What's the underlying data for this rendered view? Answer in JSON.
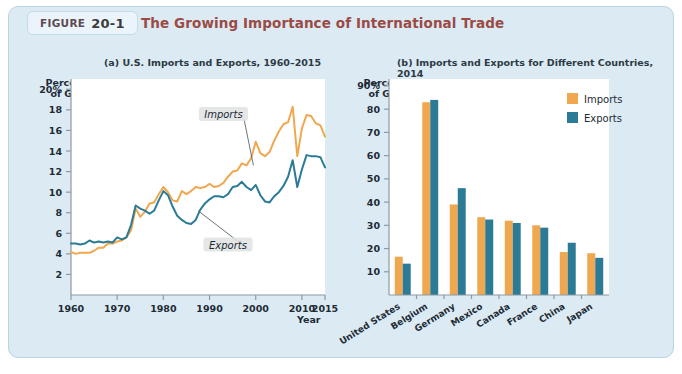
{
  "figure": {
    "tag_label": "FIGURE",
    "number": "20-1",
    "title": "The Growing Importance of International Trade",
    "title_color": "#9b4a45",
    "panel_bg": "#dceaf3"
  },
  "colors": {
    "imports": "#efa84f",
    "exports": "#2c7b96",
    "axis": "#8a9aa6",
    "text": "#1d2b36"
  },
  "chart_data": [
    {
      "type": "line",
      "panel": "a",
      "title": "(a) U.S. Imports and Exports, 1960–2015",
      "ylabel": "Percent of GDP",
      "xlabel": "Year",
      "ylim": [
        0,
        21
      ],
      "xlim": [
        1960,
        2015
      ],
      "yticks": [
        2,
        4,
        6,
        8,
        10,
        12,
        14,
        16,
        18,
        20
      ],
      "ytick_labels": [
        "2",
        "4",
        "6",
        "8",
        "10",
        "12",
        "14",
        "16",
        "18",
        "20%"
      ],
      "xticks": [
        1960,
        1970,
        1980,
        1990,
        2000,
        2010,
        2015
      ],
      "xtick_labels": [
        "1960",
        "1970",
        "1980",
        "1990",
        "2000",
        "2010",
        "2015"
      ],
      "grid": false,
      "annotations": [
        {
          "label": "Imports",
          "x": 1993,
          "y": 17.6
        },
        {
          "label": "Exports",
          "x": 1994,
          "y": 4.9
        }
      ],
      "series": [
        {
          "name": "Imports",
          "color": "#efa84f",
          "x": [
            1960,
            1961,
            1962,
            1963,
            1964,
            1965,
            1966,
            1967,
            1968,
            1969,
            1970,
            1971,
            1972,
            1973,
            1974,
            1975,
            1976,
            1977,
            1978,
            1979,
            1980,
            1981,
            1982,
            1983,
            1984,
            1985,
            1986,
            1987,
            1988,
            1989,
            1990,
            1991,
            1992,
            1993,
            1994,
            1995,
            1996,
            1997,
            1998,
            1999,
            2000,
            2001,
            2002,
            2003,
            2004,
            2005,
            2006,
            2007,
            2008,
            2009,
            2010,
            2011,
            2012,
            2013,
            2014,
            2015
          ],
          "values": [
            4.2,
            4.0,
            4.1,
            4.1,
            4.1,
            4.3,
            4.6,
            4.6,
            5.0,
            5.0,
            5.2,
            5.3,
            5.6,
            6.3,
            8.4,
            7.6,
            8.1,
            8.9,
            9.0,
            9.8,
            10.5,
            10.0,
            9.2,
            9.1,
            10.1,
            9.8,
            10.1,
            10.5,
            10.4,
            10.5,
            10.8,
            10.5,
            10.6,
            10.9,
            11.5,
            12.0,
            12.1,
            12.8,
            12.6,
            13.3,
            14.9,
            13.8,
            13.5,
            13.9,
            15.0,
            15.9,
            16.6,
            16.8,
            18.3,
            13.5,
            16.2,
            17.5,
            17.4,
            16.7,
            16.5,
            15.4
          ]
        },
        {
          "name": "Exports",
          "color": "#2c7b96",
          "x": [
            1960,
            1961,
            1962,
            1963,
            1964,
            1965,
            1966,
            1967,
            1968,
            1969,
            1970,
            1971,
            1972,
            1973,
            1974,
            1975,
            1976,
            1977,
            1978,
            1979,
            1980,
            1981,
            1982,
            1983,
            1984,
            1985,
            1986,
            1987,
            1988,
            1989,
            1990,
            1991,
            1992,
            1993,
            1994,
            1995,
            1996,
            1997,
            1998,
            1999,
            2000,
            2001,
            2002,
            2003,
            2004,
            2005,
            2006,
            2007,
            2008,
            2009,
            2010,
            2011,
            2012,
            2013,
            2014,
            2015
          ],
          "values": [
            5.0,
            5.0,
            4.9,
            5.0,
            5.3,
            5.1,
            5.2,
            5.1,
            5.2,
            5.1,
            5.6,
            5.4,
            5.6,
            6.8,
            8.7,
            8.4,
            8.2,
            7.9,
            8.2,
            9.2,
            10.1,
            9.7,
            8.6,
            7.7,
            7.3,
            7.0,
            6.9,
            7.3,
            8.3,
            8.9,
            9.3,
            9.6,
            9.6,
            9.5,
            9.8,
            10.5,
            10.6,
            11.0,
            10.5,
            10.2,
            10.7,
            9.7,
            9.1,
            9.0,
            9.6,
            10.0,
            10.6,
            11.5,
            13.1,
            10.5,
            12.2,
            13.6,
            13.5,
            13.5,
            13.4,
            12.4
          ]
        }
      ]
    },
    {
      "type": "bar",
      "panel": "b",
      "title": "(b) Imports and Exports for Different Countries, 2014",
      "ylabel": "Percent of GDP",
      "xlabel": "",
      "ylim": [
        0,
        93
      ],
      "yticks": [
        10,
        20,
        30,
        40,
        50,
        60,
        70,
        80,
        90
      ],
      "ytick_labels": [
        "10",
        "20",
        "30",
        "40",
        "50",
        "60",
        "70",
        "80",
        "90%"
      ],
      "grid": false,
      "legend_position": "top-right",
      "categories": [
        "United States",
        "Belgium",
        "Germany",
        "Mexico",
        "Canada",
        "France",
        "China",
        "Japan"
      ],
      "series": [
        {
          "name": "Imports",
          "color": "#efa84f",
          "values": [
            16.5,
            83,
            39,
            33.5,
            32,
            30,
            18.5,
            18
          ]
        },
        {
          "name": "Exports",
          "color": "#2c7b96",
          "values": [
            13.5,
            84,
            46,
            32.5,
            31,
            29,
            22.5,
            16
          ]
        }
      ]
    }
  ]
}
